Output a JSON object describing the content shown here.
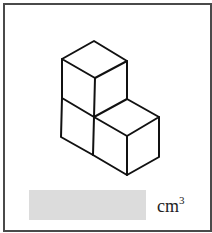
{
  "figure": {
    "cube_count": 3,
    "stroke_color": "#111111"
  },
  "answer": {
    "value": "",
    "box_color": "#dcdcdc"
  },
  "unit": {
    "base": "cm",
    "exponent": "3"
  }
}
